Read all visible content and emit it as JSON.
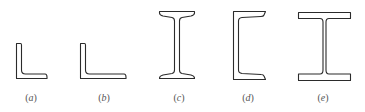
{
  "figure": {
    "stroke_color": "#2b2b2b",
    "label_color": "#555555",
    "items": [
      {
        "id": "a",
        "shape": "equal-angle-section",
        "open": "(",
        "letter": "a",
        "close": ")"
      },
      {
        "id": "b",
        "shape": "unequal-angle-section",
        "open": "(",
        "letter": "b",
        "close": ")"
      },
      {
        "id": "c",
        "shape": "i-beam-tapered-flange-section",
        "open": "(",
        "letter": "c",
        "close": ")"
      },
      {
        "id": "d",
        "shape": "channel-section",
        "open": "(",
        "letter": "d",
        "close": ")"
      },
      {
        "id": "e",
        "shape": "wide-flange-h-section",
        "open": "(",
        "letter": "e",
        "close": ")"
      }
    ]
  }
}
